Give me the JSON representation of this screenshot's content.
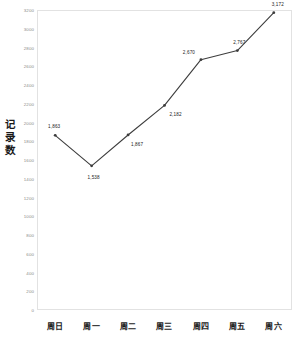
{
  "chart_data": {
    "type": "line",
    "title": "",
    "xlabel": "",
    "ylabel": "记录数",
    "categories": [
      "周日",
      "周一",
      "周二",
      "周三",
      "周四",
      "周五",
      "周六"
    ],
    "values": [
      1863,
      1538,
      1867,
      2182,
      2670,
      2767,
      3172
    ],
    "point_labels": [
      "1,863",
      "1,538",
      "1,867",
      "2,182",
      "2,670",
      "2,767",
      "3,172"
    ],
    "ylim": [
      0,
      3200
    ],
    "ytick_values": [
      0,
      200,
      400,
      600,
      800,
      1000,
      1200,
      1400,
      1600,
      1800,
      2000,
      2200,
      2400,
      2600,
      2800,
      3000,
      3200
    ],
    "ytick_labels": [
      "0",
      "200",
      "400",
      "600",
      "800",
      "1000",
      "1200",
      "1400",
      "1600",
      "1800",
      "2000",
      "2200",
      "2400",
      "2600",
      "2800",
      "3000",
      "3200"
    ],
    "grid": false,
    "legend": false,
    "legend_position": "none",
    "series": [
      {
        "name": "记录数",
        "values": [
          1863,
          1538,
          1867,
          2182,
          2670,
          2767,
          3172
        ]
      }
    ],
    "colors": {
      "line": "#3d3d3d",
      "marker": "#3d3d3d",
      "frame": "#e2e2e2",
      "tick_text": "#8a8a8a",
      "label_text": "#1a1a1a",
      "background": "#ffffff"
    },
    "label_offsets": [
      {
        "dx": -1,
        "dy": -9
      },
      {
        "dx": 2,
        "dy": 11
      },
      {
        "dx": 9,
        "dy": 9
      },
      {
        "dx": 11,
        "dy": 9
      },
      {
        "dx": -12,
        "dy": -8
      },
      {
        "dx": 2,
        "dy": -9
      },
      {
        "dx": 4,
        "dy": -9
      }
    ]
  },
  "axis_title_chars": [
    "记",
    "录",
    "数"
  ]
}
